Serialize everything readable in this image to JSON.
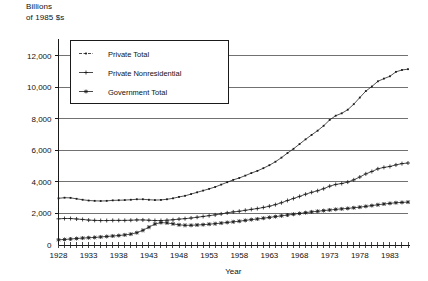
{
  "chart_data": {
    "type": "line",
    "title": "",
    "subtitle": "",
    "ylabel_top": "Billions\nof 1985 $s",
    "xlabel": "Year",
    "ylabel": "",
    "ylim": [
      0,
      13000
    ],
    "xlim": [
      1928,
      1986
    ],
    "ytick_values": [
      0,
      2000,
      4000,
      6000,
      8000,
      10000,
      12000
    ],
    "ytick_labels": [
      "0",
      "2,000",
      "4,000",
      "6,000",
      "8,000",
      "10,000",
      "12,000"
    ],
    "xtick_labels": [
      "1928",
      "1933",
      "1938",
      "1943",
      "1948",
      "1953",
      "1958",
      "1963",
      "1968",
      "1973",
      "1978",
      "1983"
    ],
    "xtick_values": [
      1928,
      1933,
      1938,
      1943,
      1948,
      1953,
      1958,
      1963,
      1968,
      1973,
      1978,
      1983
    ],
    "x_minor_step": 1,
    "grid": "horizontal",
    "legend_position": "upper-left",
    "x": [
      1928,
      1929,
      1930,
      1931,
      1932,
      1933,
      1934,
      1935,
      1936,
      1937,
      1938,
      1939,
      1940,
      1941,
      1942,
      1943,
      1944,
      1945,
      1946,
      1947,
      1948,
      1949,
      1950,
      1951,
      1952,
      1953,
      1954,
      1955,
      1956,
      1957,
      1958,
      1959,
      1960,
      1961,
      1962,
      1963,
      1964,
      1965,
      1966,
      1967,
      1968,
      1969,
      1970,
      1971,
      1972,
      1973,
      1974,
      1975,
      1976,
      1977,
      1978,
      1979,
      1980,
      1981,
      1982,
      1983,
      1984,
      1985,
      1986
    ],
    "series": [
      {
        "name": "Private Total",
        "marker": "dash-dot",
        "color": "#1a1a1a",
        "values": [
          2960,
          3000,
          2990,
          2930,
          2870,
          2820,
          2800,
          2790,
          2800,
          2830,
          2840,
          2850,
          2870,
          2900,
          2900,
          2870,
          2850,
          2860,
          2900,
          2960,
          3050,
          3120,
          3230,
          3340,
          3450,
          3560,
          3680,
          3830,
          3980,
          4130,
          4250,
          4400,
          4560,
          4700,
          4870,
          5060,
          5280,
          5540,
          5830,
          6100,
          6400,
          6700,
          6980,
          7250,
          7560,
          7930,
          8200,
          8350,
          8580,
          8930,
          9350,
          9760,
          10050,
          10380,
          10550,
          10700,
          10980,
          11100,
          11150
        ]
      },
      {
        "name": "Private Nonresidential",
        "marker": "plus",
        "color": "#1a1a1a",
        "values": [
          1660,
          1680,
          1680,
          1650,
          1620,
          1580,
          1560,
          1550,
          1550,
          1560,
          1560,
          1560,
          1570,
          1590,
          1590,
          1570,
          1550,
          1550,
          1570,
          1600,
          1640,
          1670,
          1710,
          1760,
          1810,
          1860,
          1910,
          1970,
          2040,
          2100,
          2140,
          2200,
          2260,
          2310,
          2380,
          2460,
          2560,
          2680,
          2820,
          2950,
          3080,
          3220,
          3340,
          3440,
          3570,
          3730,
          3840,
          3900,
          3990,
          4130,
          4310,
          4510,
          4660,
          4830,
          4920,
          4980,
          5080,
          5160,
          5200
        ]
      },
      {
        "name": "Government Total",
        "marker": "star",
        "color": "#1a1a1a",
        "values": [
          330,
          350,
          380,
          410,
          440,
          460,
          480,
          510,
          540,
          570,
          600,
          640,
          690,
          780,
          930,
          1130,
          1330,
          1420,
          1400,
          1340,
          1280,
          1250,
          1250,
          1270,
          1290,
          1320,
          1350,
          1390,
          1430,
          1470,
          1510,
          1560,
          1610,
          1650,
          1700,
          1750,
          1800,
          1850,
          1900,
          1950,
          2000,
          2050,
          2100,
          2140,
          2180,
          2220,
          2260,
          2290,
          2320,
          2360,
          2400,
          2450,
          2500,
          2550,
          2600,
          2640,
          2680,
          2700,
          2720
        ]
      }
    ]
  },
  "axes": {
    "x_axis_name": "year-axis",
    "y_axis_name": "value-axis"
  }
}
